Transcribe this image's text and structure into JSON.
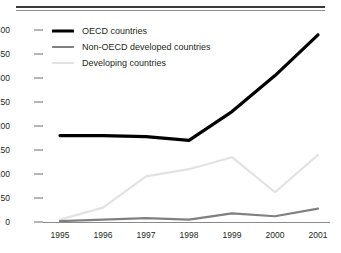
{
  "chart_data": {
    "type": "line",
    "title": "1995–2001",
    "xlabel": "",
    "ylabel": "",
    "categories": [
      "1995",
      "1996",
      "1997",
      "1998",
      "1999",
      "2000",
      "2001"
    ],
    "x": [
      1995,
      1996,
      1997,
      1998,
      1999,
      2000,
      2001
    ],
    "ylim": [
      0,
      400
    ],
    "yticks": [
      0,
      50,
      100,
      150,
      200,
      250,
      300,
      350,
      400
    ],
    "ytick_labels": [
      "0",
      "50",
      "100",
      "150",
      "200",
      "250",
      "300",
      "350",
      "400"
    ],
    "grid": false,
    "legend_position": "top-left",
    "series": [
      {
        "name": "OECD countries",
        "color": "#000000",
        "width": 3.2,
        "values": [
          180,
          180,
          178,
          170,
          230,
          305,
          390
        ]
      },
      {
        "name": "Non-OECD developed countries",
        "color": "#808080",
        "width": 2.2,
        "values": [
          2,
          5,
          8,
          5,
          18,
          12,
          28
        ]
      },
      {
        "name": "Developing countries",
        "color": "#e2e2e2",
        "width": 2.2,
        "values": [
          5,
          30,
          95,
          110,
          135,
          62,
          140
        ]
      }
    ]
  },
  "legend": {
    "items": [
      {
        "label": "OECD countries"
      },
      {
        "label": "Non-OECD developed countries"
      },
      {
        "label": "Developing countries"
      }
    ]
  }
}
